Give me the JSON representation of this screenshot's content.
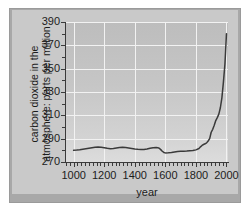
{
  "chart_data": {
    "type": "line",
    "title": "",
    "xlabel": "year",
    "ylabel_line1": "carbon dioxide in the",
    "ylabel_line2": "atmosphere: parts per million",
    "xlim": [
      950,
      2010
    ],
    "ylim": [
      270,
      390
    ],
    "xticks": [
      "1000",
      "1200",
      "1400",
      "1600",
      "1800",
      "2000"
    ],
    "xtick_values": [
      1000,
      1200,
      1400,
      1600,
      1800,
      2000
    ],
    "yticks": [
      "270",
      "290",
      "310",
      "330",
      "350",
      "370",
      "390"
    ],
    "ytick_values": [
      270,
      290,
      310,
      330,
      350,
      370,
      390
    ],
    "grid": true,
    "legend": "none",
    "line_color": "#3a3a3a",
    "plot_background": "#c6c6c6",
    "gridline_color": "#f2f2f2",
    "series": [
      {
        "name": "atmospheric CO2",
        "x": [
          1000,
          1020,
          1040,
          1060,
          1080,
          1100,
          1120,
          1140,
          1160,
          1180,
          1200,
          1220,
          1240,
          1260,
          1280,
          1300,
          1320,
          1340,
          1360,
          1380,
          1400,
          1420,
          1440,
          1460,
          1480,
          1500,
          1520,
          1540,
          1550,
          1560,
          1570,
          1580,
          1590,
          1600,
          1620,
          1640,
          1660,
          1680,
          1700,
          1720,
          1740,
          1760,
          1780,
          1800,
          1820,
          1830,
          1840,
          1850,
          1860,
          1870,
          1880,
          1890,
          1900,
          1910,
          1920,
          1930,
          1940,
          1950,
          1960,
          1970,
          1980,
          1990,
          2000
        ],
        "y": [
          280.0,
          280.2,
          280.5,
          281.0,
          281.4,
          281.8,
          282.2,
          282.6,
          282.8,
          282.6,
          282.2,
          281.7,
          281.4,
          281.6,
          282.0,
          282.4,
          282.6,
          282.4,
          282.0,
          281.6,
          281.2,
          280.9,
          280.7,
          280.8,
          281.2,
          281.8,
          282.2,
          282.4,
          282.3,
          281.8,
          280.6,
          279.2,
          278.2,
          277.8,
          277.9,
          278.2,
          278.6,
          279.0,
          279.2,
          279.3,
          279.4,
          279.6,
          279.8,
          280.4,
          281.6,
          283.0,
          284.2,
          285.0,
          285.6,
          286.4,
          288.0,
          290.0,
          295.5,
          298.0,
          301.5,
          305.5,
          308.0,
          311.0,
          316.5,
          325.0,
          338.5,
          354.0,
          380.0
        ]
      }
    ],
    "annotations": []
  },
  "axis": {
    "xtitle": "year",
    "ytitle_line1": "carbon dioxide in the",
    "ytitle_line2": "atmosphere: parts per million"
  }
}
